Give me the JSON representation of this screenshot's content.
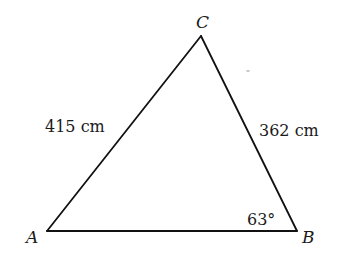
{
  "diagram": {
    "type": "triangle",
    "vertices": [
      {
        "name": "A",
        "x": 47,
        "y": 231,
        "label_x": 26,
        "label_y": 243
      },
      {
        "name": "B",
        "x": 297,
        "y": 231,
        "label_x": 302,
        "label_y": 243
      },
      {
        "name": "C",
        "x": 201,
        "y": 36,
        "label_x": 196,
        "label_y": 28
      }
    ],
    "sides": [
      {
        "from": "A",
        "to": "C",
        "length_label": "415 cm",
        "label_x": 45,
        "label_y": 132
      },
      {
        "from": "C",
        "to": "B",
        "length_label": "362 cm",
        "label_x": 259,
        "label_y": 136
      },
      {
        "from": "A",
        "to": "B",
        "length_label": ""
      }
    ],
    "angles": [
      {
        "vertex": "B",
        "label": "63°",
        "label_x": 247,
        "label_y": 225
      }
    ],
    "stroke_color": "#111111",
    "text_color": "#1a1a1a",
    "background": "#ffffff"
  }
}
